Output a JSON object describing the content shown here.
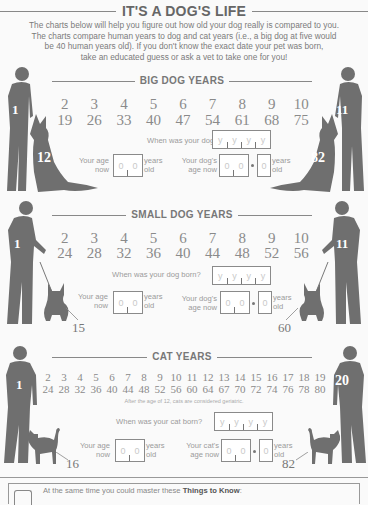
{
  "header": {
    "title": "IT'S A DOG'S LIFE",
    "intro_lines": [
      "The charts below will help you figure out how old your dog really is compared to you.",
      "The charts compare human years to dog and cat years (i.e., a big dog at five would",
      "be 40 human years old). If you don't know the exact date your pet was born,",
      "take an educated guess or ask a vet to take one for you!"
    ]
  },
  "sections": [
    {
      "id": "big-dog",
      "heading": "BIG DOG YEARS",
      "left_person_number": "1",
      "left_pet_number": "12",
      "right_person_number": "11",
      "right_pet_number": "82",
      "pet_years": [
        "2",
        "3",
        "4",
        "5",
        "6",
        "7",
        "8",
        "9",
        "10"
      ],
      "human_years": [
        "19",
        "26",
        "33",
        "40",
        "47",
        "54",
        "61",
        "68",
        "75"
      ],
      "born_question": "When was your dog born?",
      "year_placeholder": [
        "y",
        "y",
        "y",
        "y"
      ],
      "your_age_label_1": "Your age",
      "your_age_label_2": "now",
      "pet_age_label_1": "Your dog's",
      "pet_age_label_2": "age now",
      "digit_placeholder": "0",
      "years_label": "years",
      "old_label": "old"
    },
    {
      "id": "small-dog",
      "heading": "SMALL DOG YEARS",
      "left_person_number": "1",
      "left_pet_number": "15",
      "right_person_number": "11",
      "right_pet_number": "60",
      "pet_years": [
        "2",
        "3",
        "4",
        "5",
        "6",
        "7",
        "8",
        "9",
        "10"
      ],
      "human_years": [
        "24",
        "28",
        "32",
        "36",
        "40",
        "44",
        "48",
        "52",
        "56"
      ],
      "born_question": "When was your dog born?",
      "year_placeholder": [
        "y",
        "y",
        "y",
        "y"
      ],
      "your_age_label_1": "Your age",
      "your_age_label_2": "now",
      "pet_age_label_1": "Your dog's",
      "pet_age_label_2": "age now",
      "digit_placeholder": "0",
      "years_label": "years",
      "old_label": "old"
    },
    {
      "id": "cat",
      "heading": "CAT YEARS",
      "left_person_number": "1",
      "left_pet_number": "16",
      "right_person_number": "20",
      "right_pet_number": "82",
      "pet_years": [
        "2",
        "3",
        "4",
        "5",
        "6",
        "7",
        "8",
        "9",
        "10",
        "11",
        "12",
        "13",
        "14",
        "15",
        "16",
        "17",
        "18",
        "19"
      ],
      "human_years": [
        "24",
        "28",
        "32",
        "36",
        "40",
        "44",
        "48",
        "52",
        "56",
        "60",
        "64",
        "67",
        "70",
        "72",
        "74",
        "76",
        "78",
        "80"
      ],
      "note": "After the age of 12, cats are considered geriatric.",
      "born_question": "When was your cat born?",
      "year_placeholder": [
        "y",
        "y",
        "y",
        "y"
      ],
      "your_age_label_1": "Your age",
      "your_age_label_2": "now",
      "pet_age_label_1": "Your cat's",
      "pet_age_label_2": "age now",
      "digit_placeholder": "0",
      "years_label": "years",
      "old_label": "old"
    }
  ],
  "footer": {
    "text_prefix": "At the same time you could master these ",
    "text_bold": "Things to Know",
    "text_suffix": ":",
    "icon": "checklist-icon"
  },
  "colors": {
    "silhouette": "#6f6f6f",
    "text": "#777777",
    "background": "#fafafa"
  }
}
